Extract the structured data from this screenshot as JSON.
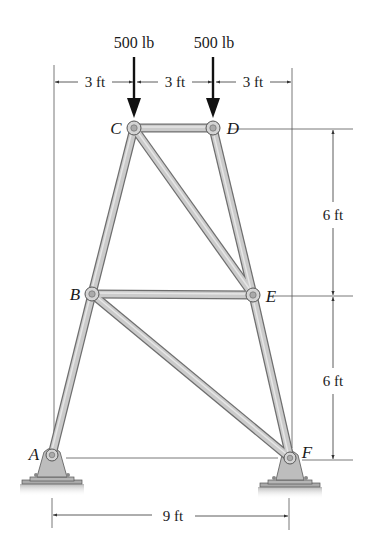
{
  "diagram": {
    "type": "truss",
    "joints": [
      {
        "id": "A",
        "label": "A",
        "x": 52,
        "y": 455,
        "support": "pin"
      },
      {
        "id": "B",
        "label": "B",
        "x": 92,
        "y": 294
      },
      {
        "id": "C",
        "label": "C",
        "x": 134,
        "y": 128
      },
      {
        "id": "D",
        "label": "D",
        "x": 213,
        "y": 128
      },
      {
        "id": "E",
        "label": "E",
        "x": 253,
        "y": 295
      },
      {
        "id": "F",
        "label": "F",
        "x": 290,
        "y": 458,
        "support": "pin"
      }
    ],
    "members": [
      [
        "A",
        "B"
      ],
      [
        "B",
        "C"
      ],
      [
        "C",
        "D"
      ],
      [
        "D",
        "E"
      ],
      [
        "E",
        "F"
      ],
      [
        "B",
        "E"
      ],
      [
        "C",
        "E"
      ],
      [
        "B",
        "F"
      ]
    ],
    "loads": [
      {
        "joint": "C",
        "label": "500 lb",
        "direction": "down"
      },
      {
        "joint": "D",
        "label": "500 lb",
        "direction": "down"
      }
    ],
    "dimensions": {
      "top": [
        "3 ft",
        "3 ft",
        "3 ft"
      ],
      "right_upper": "6 ft",
      "right_lower": "6 ft",
      "bottom": "9 ft"
    },
    "colors": {
      "member_fill": "#c8c8c8",
      "member_edge": "#6e6e6e",
      "support_fill": "#bdbdbd",
      "line": "#333333",
      "arrow": "#111111"
    }
  }
}
